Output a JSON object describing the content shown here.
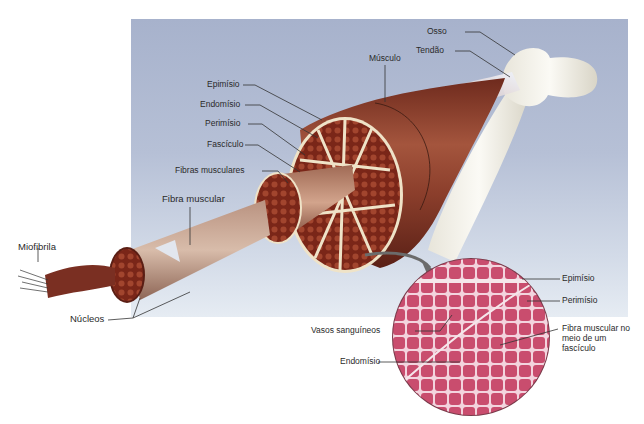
{
  "diagram": {
    "colors": {
      "background_panel": "#b6c0d6",
      "muscle": "#8a3b2a",
      "fascicle_fill": "#7a2a1c",
      "connective_tissue": "#efe3c8",
      "bone": "#f1efe6",
      "tendon": "#dfe6f2",
      "micrograph": "#c24a6a",
      "leader_line": "#333333"
    },
    "labels": {
      "osso": "Osso",
      "tendao": "Tendão",
      "musculo": "Músculo",
      "epimisio": "Epimísio",
      "endomisio": "Endomísio",
      "perimisio": "Perimísio",
      "fasciculo": "Fascículo",
      "fibras_musculares": "Fibras musculares",
      "fibra_muscular": "Fibra muscular",
      "miofibrila": "Miofibrila",
      "nucleos": "Núcleos"
    },
    "micrograph": {
      "labels": {
        "epimisio": "Epimísio",
        "perimisio": "Perimísio",
        "vasos_sanguineos": "Vasos sanguíneos",
        "endomisio": "Endomísio",
        "fibra_muscular_fasciculo": "Fibra muscular no meio de um fascículo"
      }
    }
  }
}
